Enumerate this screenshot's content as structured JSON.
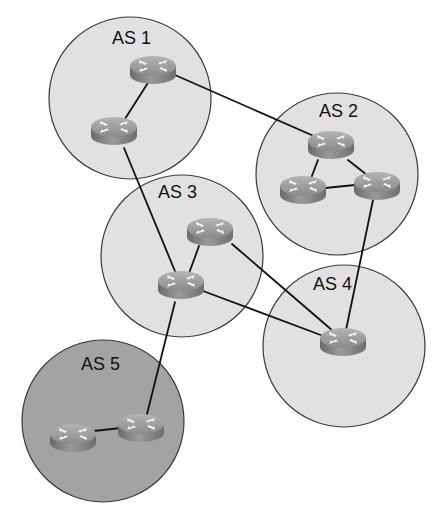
{
  "diagram": {
    "type": "network-topology",
    "canvas": {
      "width": 446,
      "height": 519,
      "background": "#ffffff"
    },
    "colors": {
      "as_fill": "#e1e1e1",
      "as_fill_dark": "#a3a3a3",
      "as_stroke": "#3a3a3a",
      "link": "#111111",
      "router_top": "#9a9a9a",
      "router_side": "#7a7a7a",
      "router_arrow": "#f4f4f4"
    },
    "autonomous_systems": [
      {
        "id": "as1",
        "label": "AS 1",
        "cx": 130,
        "cy": 98,
        "r": 81,
        "fill": "light",
        "label_x": 112,
        "label_y": 44
      },
      {
        "id": "as2",
        "label": "AS 2",
        "cx": 337,
        "cy": 174,
        "r": 81,
        "fill": "light",
        "label_x": 319,
        "label_y": 117
      },
      {
        "id": "as3",
        "label": "AS 3",
        "cx": 182,
        "cy": 256,
        "r": 81,
        "fill": "light",
        "label_x": 158,
        "label_y": 198
      },
      {
        "id": "as4",
        "label": "AS 4",
        "cx": 344,
        "cy": 346,
        "r": 81,
        "fill": "light",
        "label_x": 313,
        "label_y": 290
      },
      {
        "id": "as5",
        "label": "AS 5",
        "cx": 103,
        "cy": 421,
        "r": 81,
        "fill": "dark",
        "label_x": 81,
        "label_y": 370
      }
    ],
    "routers": [
      {
        "id": "r1a",
        "as": "as1",
        "x": 153,
        "y": 66
      },
      {
        "id": "r1b",
        "as": "as1",
        "x": 114,
        "y": 127
      },
      {
        "id": "r2a",
        "as": "as2",
        "x": 331,
        "y": 141
      },
      {
        "id": "r2b",
        "as": "as2",
        "x": 303,
        "y": 186
      },
      {
        "id": "r2c",
        "as": "as2",
        "x": 377,
        "y": 182
      },
      {
        "id": "r3a",
        "as": "as3",
        "x": 210,
        "y": 228
      },
      {
        "id": "r3b",
        "as": "as3",
        "x": 181,
        "y": 281
      },
      {
        "id": "r4",
        "as": "as4",
        "x": 343,
        "y": 338
      },
      {
        "id": "r5a",
        "as": "as5",
        "x": 73,
        "y": 434
      },
      {
        "id": "r5b",
        "as": "as5",
        "x": 141,
        "y": 424
      }
    ],
    "links": [
      {
        "from": "r1a",
        "to": "r1b",
        "x1": 153,
        "y1": 75,
        "x2": 114,
        "y2": 136
      },
      {
        "from": "r1a",
        "to": "r2a",
        "x1": 175,
        "y1": 75,
        "x2": 316,
        "y2": 137
      },
      {
        "from": "r1b",
        "to": "r3b",
        "x1": 124,
        "y1": 148,
        "x2": 177,
        "y2": 276
      },
      {
        "from": "r2a",
        "to": "r2b",
        "x1": 318,
        "y1": 160,
        "x2": 310,
        "y2": 181
      },
      {
        "from": "r2a",
        "to": "r2c",
        "x1": 348,
        "y1": 160,
        "x2": 367,
        "y2": 175
      },
      {
        "from": "r2b",
        "to": "r2c",
        "x1": 325,
        "y1": 188,
        "x2": 355,
        "y2": 185
      },
      {
        "from": "r2c",
        "to": "r4",
        "x1": 373,
        "y1": 200,
        "x2": 346,
        "y2": 330
      },
      {
        "from": "r3a",
        "to": "r3b",
        "x1": 199,
        "y1": 246,
        "x2": 188,
        "y2": 276
      },
      {
        "from": "r3a",
        "to": "r4",
        "x1": 232,
        "y1": 244,
        "x2": 333,
        "y2": 331
      },
      {
        "from": "r3b",
        "to": "r4",
        "x1": 203,
        "y1": 291,
        "x2": 326,
        "y2": 337
      },
      {
        "from": "r3b",
        "to": "r5b",
        "x1": 175,
        "y1": 302,
        "x2": 146,
        "y2": 418
      },
      {
        "from": "r5a",
        "to": "r5b",
        "x1": 94,
        "y1": 431,
        "x2": 121,
        "y2": 428
      }
    ]
  }
}
